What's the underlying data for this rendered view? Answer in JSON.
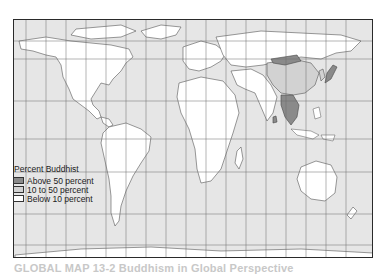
{
  "map": {
    "title": "Percent Buddhist world map",
    "colors": {
      "ocean": "#e6e6e6",
      "land": "#ffffff",
      "border": "#555555",
      "grid": "#6a6a6a",
      "frame": "#2a2a2a"
    },
    "grid": {
      "vertical_x": [
        25,
        45,
        65,
        85,
        105,
        125,
        145,
        165,
        185,
        205,
        225,
        245,
        265,
        285,
        305,
        325,
        345
      ],
      "horizontal_y": [
        40,
        58,
        100,
        138,
        171,
        213,
        244
      ]
    },
    "legend": {
      "title": "Percent Buddhist",
      "items": [
        {
          "label": "Above 50 percent",
          "color": "#8a8a8a"
        },
        {
          "label": "10 to 50 percent",
          "color": "#d2d2d2"
        },
        {
          "label": "Below 10 percent",
          "color": "#ffffff"
        }
      ]
    },
    "shaded_regions": [
      {
        "name": "Mainland Southeast Asia",
        "category": "Above 50 percent"
      },
      {
        "name": "Sri Lanka",
        "category": "Above 50 percent"
      },
      {
        "name": "Japan",
        "category": "Above 50 percent"
      },
      {
        "name": "Mongolia",
        "category": "Above 50 percent"
      },
      {
        "name": "China",
        "category": "10 to 50 percent"
      },
      {
        "name": "Korea",
        "category": "10 to 50 percent"
      }
    ]
  },
  "caption": {
    "text": "GLOBAL MAP 13-2 Buddhism in Global Perspective"
  }
}
